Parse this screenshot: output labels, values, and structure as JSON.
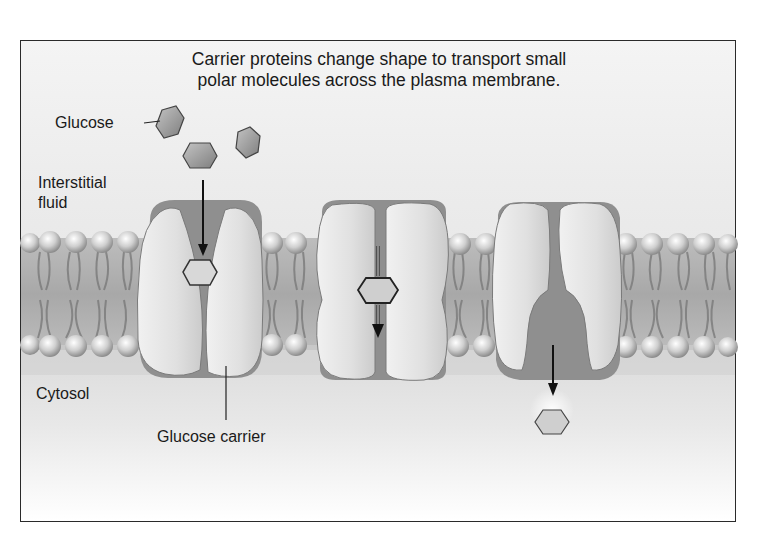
{
  "diagram": {
    "title_line1": "Carrier proteins change shape to transport small",
    "title_line2": "polar molecules across the plasma membrane.",
    "labels": {
      "glucose": "Glucose",
      "interstitial_line1": "Interstitial",
      "interstitial_line2": "fluid",
      "cytosol": "Cytosol",
      "glucose_carrier": "Glucose carrier"
    },
    "stages": [
      {
        "name": "open-to-outside",
        "description": "Glucose binds carrier open to interstitial fluid"
      },
      {
        "name": "transition",
        "description": "Carrier changes shape with glucose inside"
      },
      {
        "name": "open-to-inside",
        "description": "Glucose released into cytosol"
      }
    ],
    "colors": {
      "background": "#ffffff",
      "frame_border": "#2a2a2a",
      "protein": "#dcdcdc",
      "protein_dark": "#8a8a8a",
      "lipid_head": "#cfcfcf",
      "glucose": "#9a9a9a"
    }
  }
}
